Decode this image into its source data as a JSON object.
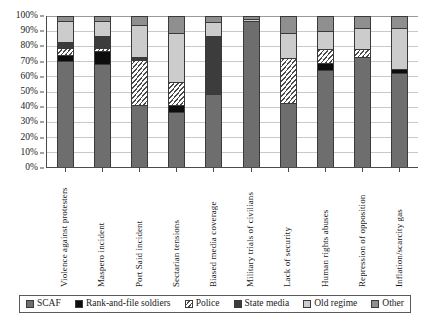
{
  "chart_data": {
    "type": "bar",
    "variant": "stacked-100-percent",
    "title": "",
    "xlabel": "",
    "ylabel": "",
    "ylim": [
      0,
      100
    ],
    "ytick_labels": [
      "100%",
      "90%",
      "80%",
      "70%",
      "60%",
      "50%",
      "40%",
      "30%",
      "20%",
      "10%",
      "0%"
    ],
    "ytick_values": [
      100,
      90,
      80,
      70,
      60,
      50,
      40,
      30,
      20,
      10,
      0
    ],
    "grid": true,
    "legend_position": "bottom",
    "categories": [
      "Violence against protesters",
      "Maspero incident",
      "Port Said incident",
      "Sectarian tensions",
      "Biased media coverage",
      "Military trials of civilians",
      "Lack of security",
      "Human rights abuses",
      "Repression of opposition",
      "Inflation/scarcity gas"
    ],
    "series": [
      {
        "name": "SCAF",
        "color": "#6e6e6e",
        "values": [
          70,
          68,
          41,
          36,
          48,
          97,
          42,
          64,
          73,
          62
        ]
      },
      {
        "name": "Rank-and-file soldiers",
        "color": "#0d0d0d",
        "values": [
          4,
          9,
          0,
          5,
          0,
          0,
          0,
          5,
          0,
          3
        ]
      },
      {
        "name": "Police",
        "color": "#ffffff",
        "values": [
          5,
          2,
          30,
          15,
          0,
          0,
          30,
          9,
          5,
          0
        ]
      },
      {
        "name": "State media",
        "color": "#3c3c3c",
        "values": [
          4,
          8,
          2,
          0,
          39,
          0,
          0,
          0,
          0,
          0
        ]
      },
      {
        "name": "Old regime",
        "color": "#cccccc",
        "values": [
          14,
          10,
          21,
          33,
          9,
          1,
          17,
          12,
          14,
          27
        ]
      },
      {
        "name": "Other",
        "color": "#8f8f8f",
        "values": [
          3,
          3,
          6,
          11,
          4,
          2,
          11,
          10,
          8,
          8
        ]
      }
    ]
  },
  "legend": {
    "items": [
      {
        "label": "SCAF"
      },
      {
        "label": "Rank-and-file soldiers"
      },
      {
        "label": "Police"
      },
      {
        "label": "State media"
      },
      {
        "label": "Old regime"
      },
      {
        "label": "Other"
      }
    ]
  }
}
